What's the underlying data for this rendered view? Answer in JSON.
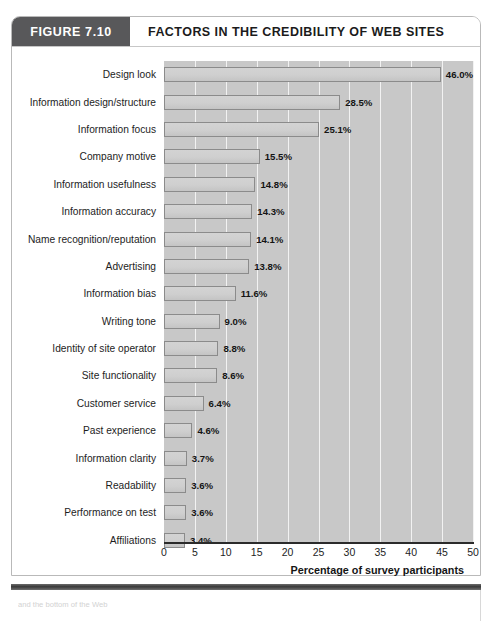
{
  "figure": {
    "badge_label": "FIGURE 7.10",
    "title": "FACTORS IN THE CREDIBILITY OF WEB SITES",
    "caption": "and the bottom of the Web"
  },
  "colors": {
    "badge_background": "#58585a",
    "plot_background": "#c8c8c8",
    "gridline": "#f2f2f2",
    "bar_fill": "#cfcfcf",
    "bar_border": "#8b8b8b",
    "axis": "#2b2b2b",
    "text": "#1d1d1d"
  },
  "chart_data": {
    "type": "bar",
    "orientation": "horizontal",
    "title": "FACTORS IN THE CREDIBILITY OF WEB SITES",
    "xlabel": "Percentage of survey participants",
    "ylabel": "",
    "xlim": [
      0,
      50
    ],
    "xticks": [
      0,
      5,
      10,
      15,
      20,
      25,
      30,
      35,
      40,
      45,
      50
    ],
    "grid": "vertical",
    "legend": "none",
    "value_suffix": "%",
    "categories": [
      "Design look",
      "Information design/structure",
      "Information focus",
      "Company motive",
      "Information usefulness",
      "Information accuracy",
      "Name recognition/reputation",
      "Advertising",
      "Information bias",
      "Writing tone",
      "Identity of site operator",
      "Site functionality",
      "Customer service",
      "Past experience",
      "Information clarity",
      "Readability",
      "Performance on test",
      "Affiliations"
    ],
    "values": [
      46.0,
      28.5,
      25.1,
      15.5,
      14.8,
      14.3,
      14.1,
      13.8,
      11.6,
      9.0,
      8.8,
      8.6,
      6.4,
      4.6,
      3.7,
      3.6,
      3.6,
      3.4
    ],
    "labels": [
      "46.0%",
      "28.5%",
      "25.1%",
      "15.5%",
      "14.8%",
      "14.3%",
      "14.1%",
      "13.8%",
      "11.6%",
      "9.0%",
      "8.8%",
      "8.6%",
      "6.4%",
      "4.6%",
      "3.7%",
      "3.6%",
      "3.6%",
      "3.4%"
    ]
  }
}
